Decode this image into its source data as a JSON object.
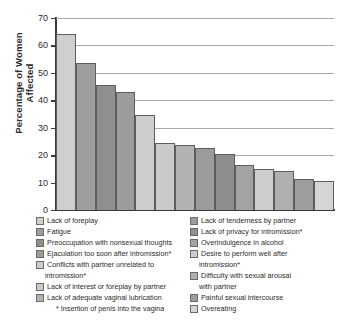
{
  "chart_data": {
    "type": "bar",
    "title": "",
    "xlabel": "",
    "ylabel": "Percentage of Women Affected",
    "ylim": [
      0,
      70
    ],
    "ytick_labels": [
      "70",
      "60",
      "50",
      "40",
      "30",
      "20",
      "10",
      "0"
    ],
    "ytick_values": [
      70,
      60,
      50,
      40,
      30,
      20,
      10,
      0
    ],
    "grid": true,
    "legend_position": "below",
    "categories": [
      "Lack of foreplay",
      "Fatigue",
      "Preoccupation with nonsexual thoughts",
      "Ejaculation too soon after intromission*",
      "Conflicts with partner unrelated to intromission*",
      "Lack of interest or foreplay by partner",
      "Lack of adequate vaginal lubrication",
      "Lack of tenderness by partner",
      "Lack of privacy for intromission*",
      "Overindulgence in alcohol",
      "Desire to perform well after intromission*",
      "Difficulty with sexual arousal with partner",
      "Painful sexual intercourse",
      "Overeating"
    ],
    "values": [
      64,
      53.5,
      45.5,
      43,
      34.5,
      24.3,
      23.7,
      22.7,
      20.3,
      16.3,
      15,
      14.3,
      11.2,
      10.4
    ],
    "colors": [
      "#cfcfcf",
      "#9e9e9e",
      "#8f8f8f",
      "#9c9c9c",
      "#cdcdcd",
      "#cacaca",
      "#b2b2b2",
      "#9b9b9b",
      "#8e8e8e",
      "#a3a3a3",
      "#cdcdcd",
      "#b0b0b0",
      "#9d9d9d",
      "#d5d5d5"
    ],
    "annotations": [
      "* Insertion of penis into the vagina"
    ]
  },
  "axis": {
    "y_title_line1": "Percentage of Women",
    "y_title_line2": "Affected"
  },
  "legend": {
    "left_column": [
      {
        "label": "Lack of foreplay",
        "color": "#cfcfcf"
      },
      {
        "label": "Fatigue",
        "color": "#9e9e9e"
      },
      {
        "label": "Preoccupation with nonsexual thoughts",
        "color": "#8f8f8f"
      },
      {
        "label": "Ejaculation too soon after intromission*",
        "color": "#9c9c9c"
      },
      {
        "label": "Conflicts with partner unrelated to",
        "label_cont": "intromission*",
        "color": "#cdcdcd"
      },
      {
        "label": "Lack of interest or foreplay by partner",
        "color": "#cacaca"
      },
      {
        "label": "Lack of adequate vaginal lubrication",
        "color": "#b2b2b2"
      }
    ],
    "right_column": [
      {
        "label": "Lack of tenderness by partner",
        "color": "#9b9b9b"
      },
      {
        "label": "Lack of privacy for intromission*",
        "color": "#8e8e8e"
      },
      {
        "label": "Overindulgence in alcohol",
        "color": "#a3a3a3"
      },
      {
        "label": "Desire to perform well after",
        "label_cont": "intromission*",
        "color": "#cdcdcd"
      },
      {
        "label": "Difficulty with sexual arousal",
        "label_cont": "with partner",
        "color": "#b0b0b0"
      },
      {
        "label": "Painful sexual intercourse",
        "color": "#9d9d9d"
      },
      {
        "label": "Overeating",
        "color": "#d5d5d5"
      }
    ]
  },
  "footnote": "* Insertion of penis into the vagina"
}
